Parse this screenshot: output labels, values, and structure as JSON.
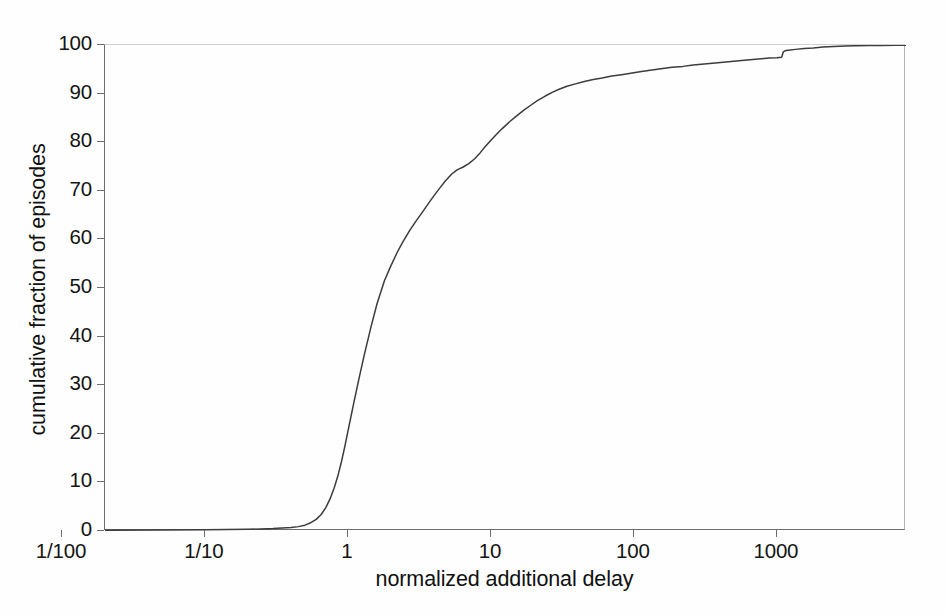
{
  "chart_data": {
    "type": "line",
    "title": "",
    "xlabel": "normalized additional delay",
    "ylabel": "cumulative fraction of episodes",
    "xscale": "log",
    "yscale": "linear",
    "xlim": [
      0.02,
      8000
    ],
    "ylim": [
      0,
      100
    ],
    "grid": false,
    "legend": null,
    "xticks": [
      {
        "value": 0.01,
        "label": "1/100"
      },
      {
        "value": 0.1,
        "label": "1/10"
      },
      {
        "value": 1,
        "label": "1"
      },
      {
        "value": 10,
        "label": "10"
      },
      {
        "value": 100,
        "label": "100"
      },
      {
        "value": 1000,
        "label": "1000"
      }
    ],
    "yticks": [
      {
        "value": 0,
        "label": "0"
      },
      {
        "value": 10,
        "label": "10"
      },
      {
        "value": 20,
        "label": "20"
      },
      {
        "value": 30,
        "label": "30"
      },
      {
        "value": 40,
        "label": "40"
      },
      {
        "value": 50,
        "label": "50"
      },
      {
        "value": 60,
        "label": "60"
      },
      {
        "value": 70,
        "label": "70"
      },
      {
        "value": 80,
        "label": "80"
      },
      {
        "value": 90,
        "label": "90"
      },
      {
        "value": 100,
        "label": "100"
      }
    ],
    "series": [
      {
        "name": "cumulative distribution",
        "color": "#3c3c3c",
        "x": [
          0.02,
          0.05,
          0.1,
          0.2,
          0.3,
          0.4,
          0.45,
          0.5,
          0.55,
          0.6,
          0.65,
          0.7,
          0.75,
          0.8,
          0.85,
          0.9,
          0.95,
          1.0,
          1.1,
          1.2,
          1.3,
          1.45,
          1.6,
          1.8,
          2.0,
          2.2,
          2.4,
          2.7,
          3.0,
          3.3,
          3.6,
          4.0,
          4.4,
          4.8,
          5.3,
          5.8,
          6.4,
          7.0,
          7.7,
          8.4,
          9.2,
          10.0,
          11.0,
          12.0,
          13.5,
          15.0,
          17.0,
          19.0,
          21.0,
          24.0,
          27.0,
          30.0,
          34.0,
          39.0,
          45.0,
          52.0,
          60.0,
          70.0,
          82.0,
          95.0,
          110.0,
          130.0,
          155.0,
          185.0,
          220.0,
          260.0,
          310.0,
          370.0,
          440.0,
          520.0,
          620.0,
          740.0,
          880.0,
          1000.0,
          1080.0,
          1110.0,
          1140.0,
          1200.0,
          1350.0,
          1550.0,
          1800.0,
          2100.0,
          2500.0,
          3000.0,
          3600.0,
          4400.0,
          5400.0,
          6600.0,
          8000.0
        ],
        "y": [
          0.15,
          0.2,
          0.25,
          0.35,
          0.5,
          0.7,
          0.9,
          1.2,
          1.7,
          2.4,
          3.4,
          4.8,
          6.6,
          8.8,
          11.3,
          14.2,
          17.3,
          20.5,
          26.4,
          31.6,
          36.2,
          42.0,
          46.8,
          51.5,
          54.6,
          57.2,
          59.3,
          61.8,
          63.8,
          65.5,
          67.1,
          69.0,
          70.6,
          72.0,
          73.4,
          74.3,
          74.9,
          75.6,
          76.6,
          77.8,
          79.2,
          80.4,
          81.7,
          82.8,
          84.2,
          85.3,
          86.6,
          87.6,
          88.5,
          89.5,
          90.3,
          90.9,
          91.5,
          92.0,
          92.5,
          92.9,
          93.2,
          93.6,
          93.9,
          94.2,
          94.5,
          94.8,
          95.1,
          95.4,
          95.6,
          95.9,
          96.1,
          96.3,
          96.5,
          96.7,
          96.9,
          97.1,
          97.3,
          97.4,
          97.5,
          98.6,
          98.8,
          98.9,
          99.1,
          99.3,
          99.4,
          99.6,
          99.7,
          99.8,
          99.85,
          99.9,
          99.92,
          99.95,
          99.97
        ]
      }
    ],
    "annotations": [
      {
        "text": "sharp vertical step in the CDF",
        "x": 1100,
        "y": 98.6
      }
    ]
  },
  "colors": {
    "curve": "#3c3c3c",
    "axis": "#6d6d6d",
    "text": "#141414",
    "background": "#fefefe"
  }
}
